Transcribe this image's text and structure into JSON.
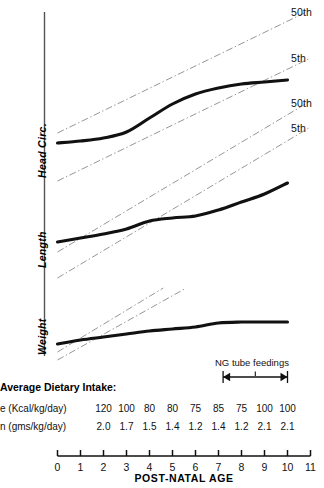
{
  "chart_data": {
    "type": "line",
    "title": "",
    "xlabel": "POST-NATAL AGE",
    "ylabel": "",
    "xlim": [
      0,
      11
    ],
    "grid": false,
    "legend_position": "right-inline",
    "x_ticks": [
      "0",
      "1",
      "2",
      "3",
      "4",
      "5",
      "6",
      "7",
      "8",
      "9",
      "10",
      "11"
    ],
    "panels": [
      {
        "name": "Head Circ.",
        "label": "Head Circ.",
        "percentile_labels": [
          "50th",
          "5th"
        ],
        "patient_series": {
          "name": "patient head circumference",
          "x": [
            0,
            1,
            2,
            3,
            4,
            5,
            6,
            7,
            8,
            9,
            10
          ],
          "y_px": [
            143,
            141,
            138,
            132,
            118,
            104,
            94,
            88,
            84,
            82,
            80
          ]
        },
        "reference_lines": [
          {
            "name": "50th",
            "x": [
              0,
              11
            ],
            "y_px": [
              133,
              10
            ]
          },
          {
            "name": "5th",
            "x": [
              0,
              11
            ],
            "y_px": [
              181,
              58
            ]
          }
        ]
      },
      {
        "name": "Length",
        "label": "Length",
        "percentile_labels": [
          "50th",
          "5th"
        ],
        "patient_series": {
          "name": "patient length",
          "x": [
            0,
            1,
            2,
            3,
            4,
            5,
            6,
            7,
            8,
            9,
            10
          ],
          "y_px": [
            242,
            238,
            234,
            229,
            221,
            218,
            216,
            210,
            202,
            194,
            183
          ]
        },
        "reference_lines": [
          {
            "name": "50th",
            "x": [
              0,
              11
            ],
            "y_px": [
              252,
              101
            ]
          },
          {
            "name": "5th",
            "x": [
              0,
              11
            ],
            "y_px": [
              278,
              127
            ]
          }
        ]
      },
      {
        "name": "Weight",
        "label": "Weight",
        "percentile_labels": [
          "50th",
          "5th"
        ],
        "patient_series": {
          "name": "patient weight",
          "x": [
            0,
            1,
            2,
            3,
            4,
            5,
            6,
            7,
            8,
            9,
            10
          ],
          "y_px": [
            344,
            340,
            337,
            334,
            331,
            329,
            327,
            323,
            322,
            322,
            322
          ]
        },
        "reference_lines": [
          {
            "name": "50th",
            "x": [
              0,
              4.6
            ],
            "y_px": [
              352,
              288
            ]
          },
          {
            "name": "5th",
            "x": [
              0,
              5.6
            ],
            "y_px": [
              360,
              288
            ]
          }
        ]
      }
    ]
  },
  "annotation": {
    "ng_tube_label": "NG tube feedings",
    "ng_start_age": 7.2,
    "ng_end_age": 10.0
  },
  "intake": {
    "title": "Average Dietary Intake:",
    "rows": [
      {
        "label": "e  (Kcal/kg/day)",
        "values": [
          "120",
          "100",
          "80",
          "80",
          "75",
          "85",
          "75",
          "100",
          "100"
        ]
      },
      {
        "label": "n (gms/kg/day)",
        "values": [
          "2.0",
          "1.7",
          "1.5",
          "1.4",
          "1.2",
          "1.4",
          "1.2",
          "2.1",
          "2.1"
        ]
      }
    ],
    "value_ages": [
      2,
      3,
      4,
      5,
      6,
      7,
      8,
      9,
      10
    ]
  },
  "colors": {
    "patient_curve": "#111111",
    "reference_line": "#8a8a8a",
    "axis": "#555555",
    "text": "#111111"
  }
}
